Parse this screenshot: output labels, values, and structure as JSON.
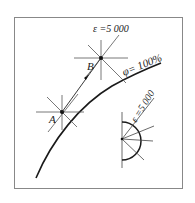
{
  "diagram": {
    "frame": {
      "x": 14,
      "y": 17,
      "width": 168,
      "height": 171
    },
    "saturation_curve": {
      "label": "φ= 100%"
    },
    "point_a": {
      "label": "A"
    },
    "point_b": {
      "label": "B"
    },
    "process_epsilon_label": "ε =5 000",
    "protractor_epsilon_label": "ε =5 000",
    "colors": {
      "line": "#1a1a1a",
      "thin_line": "#444444",
      "background": "#ffffff",
      "frame": "#888888"
    }
  }
}
